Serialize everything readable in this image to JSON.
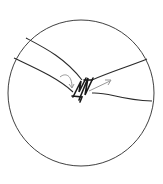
{
  "diagram": {
    "title": "",
    "elements": [
      {
        "name": "magnified-view-circle",
        "kind": "circle"
      },
      {
        "name": "left-segment",
        "kind": "tubular band"
      },
      {
        "name": "right-segment",
        "kind": "tubular band"
      },
      {
        "name": "suture-stitches",
        "kind": "zigzag suture"
      },
      {
        "name": "curved-arrow",
        "kind": "arrow",
        "direction": "curving downward-right"
      },
      {
        "name": "straight-arrow",
        "kind": "arrow",
        "direction": "up-right"
      }
    ],
    "colors": {
      "line": "#2a2a2a",
      "light_line": "#8a8a8a",
      "background": "#ffffff"
    },
    "labels": []
  }
}
